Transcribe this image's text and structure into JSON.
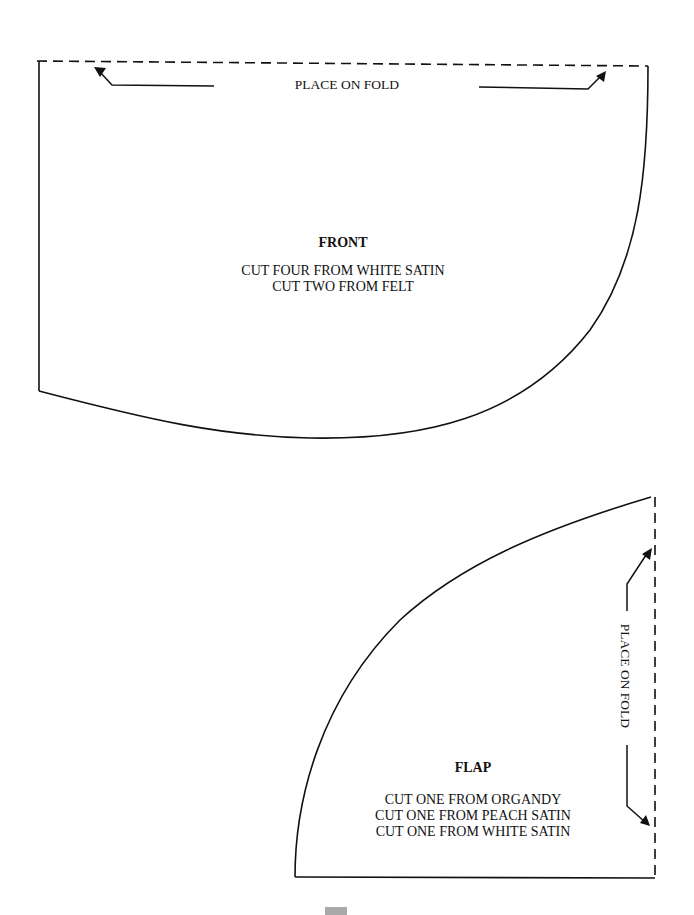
{
  "colors": {
    "line": "#111111",
    "background": "#ffffff",
    "tab": "#a9a9a9"
  },
  "front": {
    "fold_label": "PLACE ON FOLD",
    "title": "FRONT",
    "instructions": [
      "CUT FOUR FROM WHITE SATIN",
      "CUT TWO FROM FELT"
    ]
  },
  "flap": {
    "fold_label": "PLACE ON FOLD",
    "title": "FLAP",
    "instructions": [
      "CUT ONE FROM ORGANDY",
      "CUT ONE FROM PEACH SATIN",
      "CUT ONE FROM WHITE SATIN"
    ]
  }
}
